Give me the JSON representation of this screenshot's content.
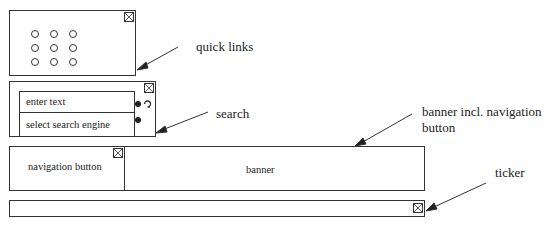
{
  "diagram": {
    "quick_links": {
      "annotation": "quick links",
      "icon_grid": {
        "rows": 3,
        "cols": 3,
        "icon": "circle-icon"
      },
      "close_icon": "close-x-icon"
    },
    "search": {
      "annotation": "search",
      "text_field": "enter text",
      "engine_field": "select search engine",
      "controls": [
        "radio-dot-icon",
        "refresh-icon",
        "radio-dot-icon"
      ],
      "close_icon": "close-x-icon"
    },
    "banner": {
      "annotation_line1": "banner incl. navigation",
      "annotation_line2": "button",
      "navigation_button": "navigation button",
      "banner_text": "banner",
      "close_icon": "close-x-icon"
    },
    "ticker": {
      "annotation": "ticker",
      "close_icon": "close-x-icon"
    },
    "colors": {
      "stroke": "#333333",
      "background": "#ffffff",
      "text": "#222222"
    }
  }
}
